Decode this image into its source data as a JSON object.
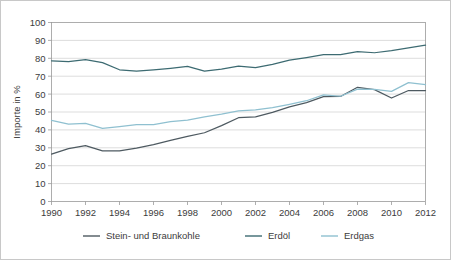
{
  "chart_data": {
    "type": "line",
    "title": "",
    "xlabel": "",
    "ylabel": "Importe in %",
    "xlim": [
      1990,
      2012
    ],
    "ylim": [
      0,
      100
    ],
    "grid": true,
    "legend_position": "bottom",
    "x": [
      1990,
      1991,
      1992,
      1993,
      1994,
      1995,
      1996,
      1997,
      1998,
      1999,
      2000,
      2001,
      2002,
      2003,
      2004,
      2005,
      2006,
      2007,
      2008,
      2009,
      2010,
      2011,
      2012
    ],
    "x_tick_labels": [
      "1990",
      "1992",
      "1994",
      "1996",
      "1998",
      "2000",
      "2002",
      "2004",
      "2006",
      "2008",
      "2010",
      "2012"
    ],
    "y_tick_labels": [
      "0",
      "10",
      "20",
      "30",
      "40",
      "50",
      "60",
      "70",
      "80",
      "90",
      "100"
    ],
    "series": [
      {
        "name": "Stein- und Braunkohle",
        "color": "#4e5a61",
        "values": [
          26.5,
          29.5,
          31.2,
          28.3,
          28.3,
          29.8,
          31.8,
          34.2,
          36.4,
          38.4,
          42.4,
          46.8,
          47.3,
          49.8,
          52.9,
          55.2,
          58.6,
          58.7,
          63.8,
          62.5,
          57.8,
          62.0,
          62.0
        ]
      },
      {
        "name": "Erdöl",
        "color": "#3d6b72",
        "values": [
          78.6,
          78.2,
          79.3,
          77.6,
          73.6,
          72.8,
          73.5,
          74.4,
          75.5,
          72.8,
          73.9,
          75.6,
          74.8,
          76.6,
          79.0,
          80.4,
          82.0,
          82.0,
          83.7,
          83.1,
          84.3,
          85.8,
          87.3
        ]
      },
      {
        "name": "Erdgas",
        "color": "#8fc0d0",
        "values": [
          45.3,
          43.2,
          43.6,
          40.8,
          41.8,
          42.9,
          43.0,
          44.6,
          45.4,
          47.3,
          48.8,
          50.6,
          51.2,
          52.5,
          54.3,
          56.3,
          59.6,
          58.8,
          62.8,
          62.6,
          61.5,
          66.4,
          65.3
        ]
      }
    ]
  },
  "legend": {
    "items": [
      {
        "label": "Stein- und Braunkohle",
        "color": "#4e5a61"
      },
      {
        "label": "Erdöl",
        "color": "#3d6b72"
      },
      {
        "label": "Erdgas",
        "color": "#8fc0d0"
      }
    ]
  },
  "colors": {
    "background": "#ffffff",
    "border": "#c8c8c8",
    "gridline": "#cfcfcf",
    "axis": "#9a9a9a",
    "text": "#3c3c3c"
  }
}
